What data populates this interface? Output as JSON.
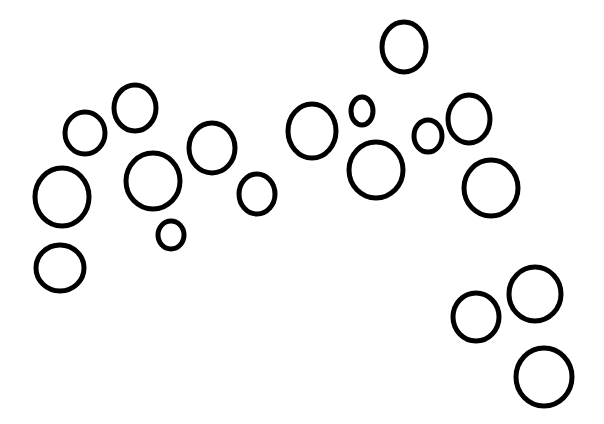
{
  "image": {
    "width": 604,
    "height": 424,
    "background": "#ffffff",
    "stroke_color": "#000000",
    "stroke_width": 5,
    "description": "Hand-drawn black outlined circles scattered on white background"
  },
  "circles": [
    {
      "cx": 85,
      "cy": 133,
      "rx": 20,
      "ry": 21
    },
    {
      "cx": 135,
      "cy": 108,
      "rx": 21,
      "ry": 23
    },
    {
      "cx": 62,
      "cy": 197,
      "rx": 27,
      "ry": 29
    },
    {
      "cx": 153,
      "cy": 181,
      "rx": 27,
      "ry": 28
    },
    {
      "cx": 212,
      "cy": 148,
      "rx": 23,
      "ry": 25
    },
    {
      "cx": 257,
      "cy": 194,
      "rx": 18,
      "ry": 20
    },
    {
      "cx": 171,
      "cy": 235,
      "rx": 13,
      "ry": 14
    },
    {
      "cx": 60,
      "cy": 268,
      "rx": 24,
      "ry": 23
    },
    {
      "cx": 312,
      "cy": 131,
      "rx": 24,
      "ry": 27
    },
    {
      "cx": 362,
      "cy": 111,
      "rx": 11,
      "ry": 14
    },
    {
      "cx": 376,
      "cy": 170,
      "rx": 27,
      "ry": 28
    },
    {
      "cx": 404,
      "cy": 47,
      "rx": 22,
      "ry": 25
    },
    {
      "cx": 428,
      "cy": 136,
      "rx": 14,
      "ry": 16
    },
    {
      "cx": 469,
      "cy": 119,
      "rx": 21,
      "ry": 24
    },
    {
      "cx": 491,
      "cy": 188,
      "rx": 27,
      "ry": 28
    },
    {
      "cx": 476,
      "cy": 317,
      "rx": 23,
      "ry": 24
    },
    {
      "cx": 535,
      "cy": 294,
      "rx": 26,
      "ry": 27
    },
    {
      "cx": 544,
      "cy": 377,
      "rx": 28,
      "ry": 29
    }
  ]
}
